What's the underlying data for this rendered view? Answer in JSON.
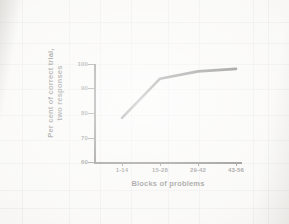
{
  "chart_data": {
    "type": "line",
    "title": "",
    "subtitle": "",
    "xlabel": "Blocks of problems",
    "ylabel": "Per cent of correct trial, two responses",
    "categories": [
      "1-14",
      "15-28",
      "29-42",
      "43-56"
    ],
    "series": [
      {
        "name": "Per cent correct",
        "values": [
          78,
          94,
          97,
          98
        ]
      }
    ],
    "ylim": [
      60,
      100
    ],
    "yticks": [
      100,
      90,
      80,
      70,
      60
    ],
    "xticks": [
      "1-14",
      "15-28",
      "29-42",
      "43-56"
    ],
    "grid": false,
    "legend": false,
    "legend_position": "none",
    "line_color": "#111111",
    "axis_color": "#1a1a1a",
    "background_color": "#f4f3f0"
  },
  "axes": {
    "y_label_line1": "Per cent of correct trial,",
    "y_label_line2": "two responses",
    "x_label": "Blocks of problems"
  }
}
